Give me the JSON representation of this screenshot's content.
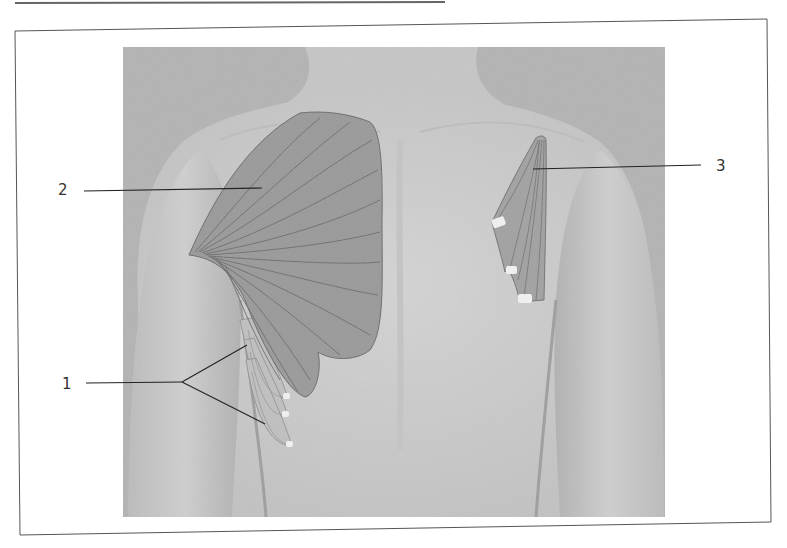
{
  "figure": {
    "background_color": "#b4b4b4",
    "skin_color": "#cdcdcd",
    "muscle_fill": "#9a9a9a",
    "muscle_line": "#6a6a6a",
    "tendon_color": "#f2f2f2",
    "frame_color": "#555555"
  },
  "labels": [
    {
      "id": "1",
      "text": "1",
      "x": 62,
      "y": 389,
      "muscle": "serratus-anterior"
    },
    {
      "id": "2",
      "text": "2",
      "x": 58,
      "y": 195,
      "muscle": "pectoralis-major"
    },
    {
      "id": "3",
      "text": "3",
      "x": 716,
      "y": 171,
      "muscle": "pectoralis-minor"
    }
  ],
  "leaders": {
    "l1": {
      "x1": 86,
      "y1": 383,
      "x2": 182,
      "y2": 382,
      "b1x": 247,
      "b1y": 345,
      "b2x": 265,
      "b2y": 424
    },
    "l2": {
      "x1": 84,
      "y1": 191,
      "x2": 262,
      "y2": 188
    },
    "l3": {
      "x1": 533,
      "y1": 169,
      "x2": 701,
      "y2": 165
    }
  }
}
